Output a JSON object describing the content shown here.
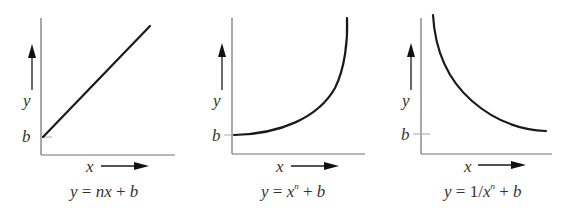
{
  "figure": {
    "panels": [
      {
        "id": "linear",
        "x_label": "x",
        "y_label": "y",
        "intercept_label": "b",
        "curve_type": "linear-increasing",
        "equation": {
          "lhs": "y",
          "eq": " = ",
          "parts": [
            "nx",
            " + ",
            "b"
          ]
        }
      },
      {
        "id": "power",
        "x_label": "x",
        "y_label": "y",
        "intercept_label": "b",
        "curve_type": "convex-increasing",
        "equation": {
          "lhs": "y",
          "eq": " = ",
          "base": "x",
          "exponent": "n",
          "rest": " + ",
          "b": "b"
        }
      },
      {
        "id": "inverse-power",
        "x_label": "x",
        "y_label": "y",
        "intercept_label": "b",
        "curve_type": "convex-decreasing",
        "equation": {
          "lhs": "y",
          "eq": " = ",
          "pre": "1/",
          "base": "x",
          "exponent": "n",
          "rest": " + ",
          "b": "b"
        }
      }
    ]
  }
}
